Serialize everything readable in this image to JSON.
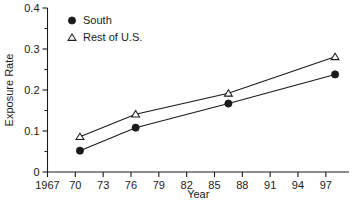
{
  "chart_data": {
    "type": "line",
    "title": "",
    "xlabel": "Year",
    "ylabel": "Exposure Rate",
    "xlim": [
      1967,
      1999.5
    ],
    "ylim": [
      0,
      0.4
    ],
    "grid": false,
    "legend_position": "top-left",
    "x_ticks": [
      1967,
      1970,
      1973,
      1976,
      1979,
      1982,
      1985,
      1988,
      1991,
      1994,
      1997
    ],
    "x_tick_labels": [
      "1967",
      "70",
      "73",
      "76",
      "79",
      "82",
      "85",
      "88",
      "91",
      "94",
      "97"
    ],
    "y_ticks": [
      0,
      0.1,
      0.2,
      0.3,
      0.4
    ],
    "y_tick_labels": [
      "0",
      "0.1",
      "0.2",
      "0.3",
      "0.4"
    ],
    "y_minor_ticks": [
      0.05,
      0.15,
      0.25,
      0.35
    ],
    "x": [
      1970.5,
      1976.5,
      1986.5,
      1998.0
    ],
    "series": [
      {
        "name": "South",
        "marker": "filled-circle",
        "values": [
          0.052,
          0.108,
          0.167,
          0.238
        ]
      },
      {
        "name": "Rest of U.S.",
        "marker": "open-triangle",
        "values": [
          0.086,
          0.141,
          0.192,
          0.281
        ]
      }
    ]
  },
  "legend": {
    "entries": [
      {
        "label": "South",
        "marker": "filled-circle"
      },
      {
        "label": "Rest of U.S.",
        "marker": "open-triangle"
      }
    ]
  },
  "axes": {
    "y_title": "Exposure Rate",
    "x_title": "Year"
  },
  "colors": {
    "ink": "#1a1a1a",
    "background": "#ffffff"
  }
}
